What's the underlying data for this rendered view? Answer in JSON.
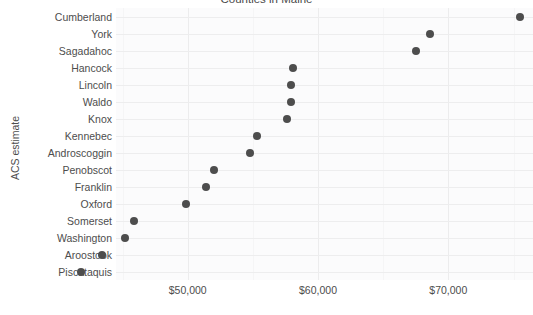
{
  "chart_data": {
    "type": "scatter",
    "title": "Counties in Maine",
    "xlabel": "",
    "ylabel": "ACS estimate",
    "orientation": "horizontal-dotplot",
    "grid": true,
    "legend": null,
    "xlim": [
      44500,
      76500
    ],
    "x_ticks": [
      {
        "value": 50000,
        "label": "$50,000"
      },
      {
        "value": 60000,
        "label": "$60,000"
      },
      {
        "value": 70000,
        "label": "$70,000"
      }
    ],
    "categories": [
      "Cumberland",
      "York",
      "Sagadahoc",
      "Hancock",
      "Lincoln",
      "Waldo",
      "Knox",
      "Kennebec",
      "Androscoggin",
      "Penobscot",
      "Franklin",
      "Oxford",
      "Somerset",
      "Washington",
      "Aroostook",
      "Piscataquis"
    ],
    "values": [
      75500,
      68600,
      67500,
      58100,
      57900,
      57900,
      57600,
      55300,
      54800,
      52000,
      51400,
      49900,
      45900,
      45200,
      43400,
      41800
    ],
    "point_color": "#4d4d4d",
    "panel_color": "#fbfbfc",
    "grid_color": "#ededee"
  }
}
